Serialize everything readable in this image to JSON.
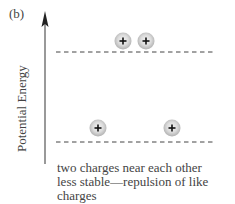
{
  "panel_label": "(b)",
  "axis": {
    "label": "Potential Energy",
    "direction": "up"
  },
  "levels": [
    {
      "name": "high-energy",
      "y": 52,
      "charges": [
        {
          "sign": "+",
          "cx": 123,
          "cy": 41
        },
        {
          "sign": "+",
          "cx": 146,
          "cy": 41
        }
      ]
    },
    {
      "name": "low-energy",
      "y": 142,
      "charges": [
        {
          "sign": "+",
          "cx": 98,
          "cy": 128
        },
        {
          "sign": "+",
          "cx": 172,
          "cy": 128
        }
      ]
    }
  ],
  "caption": {
    "line1": "two charges near each other",
    "line2": "less stable—repulsion of like",
    "line3": "charges"
  },
  "colors": {
    "charge_fill_center": "#f2f2f2",
    "charge_fill_edge": "#b5b5b5",
    "line": "#444444"
  }
}
